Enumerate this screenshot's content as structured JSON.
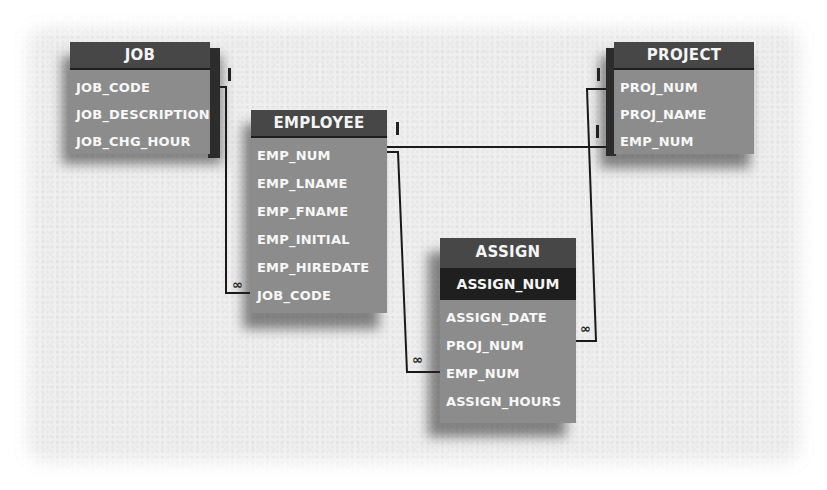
{
  "diagram": {
    "type": "entity-relationship",
    "entities": [
      {
        "name": "JOB",
        "primary_key": null,
        "attributes": [
          "JOB_CODE",
          "JOB_DESCRIPTION",
          "JOB_CHG_HOUR"
        ]
      },
      {
        "name": "EMPLOYEE",
        "primary_key": null,
        "attributes": [
          "EMP_NUM",
          "EMP_LNAME",
          "EMP_FNAME",
          "EMP_INITIAL",
          "EMP_HIREDATE",
          "JOB_CODE"
        ]
      },
      {
        "name": "PROJECT",
        "primary_key": null,
        "attributes": [
          "PROJ_NUM",
          "PROJ_NAME",
          "EMP_NUM"
        ]
      },
      {
        "name": "ASSIGN",
        "primary_key": "ASSIGN_NUM",
        "attributes": [
          "ASSIGN_DATE",
          "PROJ_NUM",
          "EMP_NUM",
          "ASSIGN_HOURS"
        ]
      }
    ],
    "relationships": [
      {
        "from": "JOB.JOB_CODE",
        "to": "EMPLOYEE.JOB_CODE",
        "from_card": "1",
        "to_card": "∞"
      },
      {
        "from": "EMPLOYEE.EMP_NUM",
        "to": "PROJECT.EMP_NUM",
        "from_card": "1",
        "to_card": "1"
      },
      {
        "from": "EMPLOYEE.EMP_NUM",
        "to": "ASSIGN.EMP_NUM",
        "from_card": "1",
        "to_card": "∞"
      },
      {
        "from": "PROJECT.PROJ_NUM",
        "to": "ASSIGN.PROJ_NUM",
        "from_card": "1",
        "to_card": "∞"
      }
    ],
    "symbols": {
      "one": "I",
      "many": "∞"
    }
  }
}
